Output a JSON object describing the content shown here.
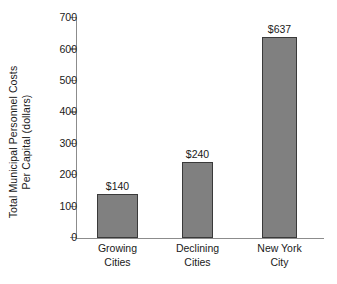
{
  "chart_data": {
    "type": "bar",
    "title": "",
    "subtitle": "",
    "xlabel": "",
    "ylabel_line1": "Total Municipal Personnel Costs",
    "ylabel_line2": "Per Capital (dollars)",
    "ylabel": "Total Municipal Personnel Costs Per Capital (dollars)",
    "categories": [
      "Growing Cities",
      "Declining Cities",
      "New York City"
    ],
    "category_lines": [
      [
        "Growing",
        "Cities"
      ],
      [
        "Declining",
        "Cities"
      ],
      [
        "New York",
        "City"
      ]
    ],
    "values": [
      140,
      240,
      637
    ],
    "data_labels": [
      "$140",
      "$240",
      "$637"
    ],
    "ylim": [
      0,
      700
    ],
    "y_ticks": [
      0,
      100,
      200,
      300,
      400,
      500,
      600,
      700
    ],
    "y_tick_labels": [
      "0",
      "100",
      "200",
      "300",
      "400",
      "500",
      "600",
      "700"
    ],
    "grid": false,
    "legend": false,
    "legend_position": "none",
    "bar_fill_color": "#808080",
    "bar_edge_color": "#3a3a3a",
    "axis_color": "#8c8c8c",
    "background_color": "#ffffff",
    "text_color": "#1a1a1a"
  }
}
